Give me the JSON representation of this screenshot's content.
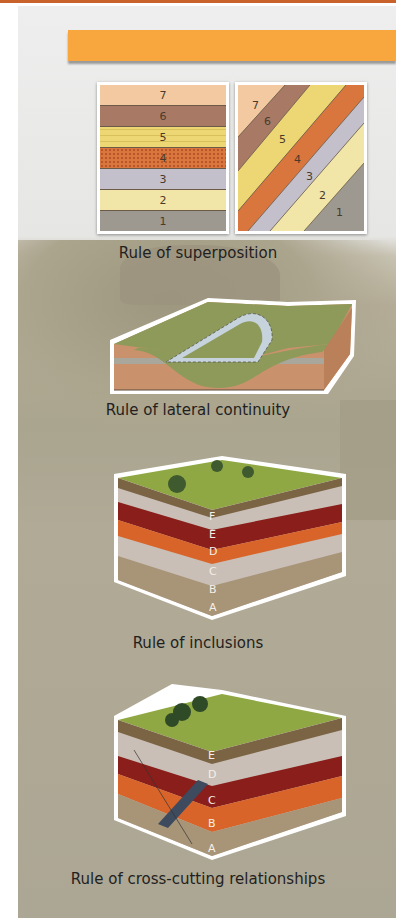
{
  "header": {
    "band_color": "#f8a63e",
    "top_rule_color": "#c8622a"
  },
  "figures": [
    {
      "id": "superposition",
      "caption": "Rule of superposition",
      "left_panel": {
        "layers": [
          {
            "label": "7",
            "color": "#f2c9a0"
          },
          {
            "label": "6",
            "color": "#a87a66"
          },
          {
            "label": "5",
            "color": "#ecd774"
          },
          {
            "label": "4",
            "color": "#d9763e"
          },
          {
            "label": "3",
            "color": "#c3c0cc"
          },
          {
            "label": "2",
            "color": "#f1e6a8"
          },
          {
            "label": "1",
            "color": "#9d9890"
          }
        ]
      },
      "right_panel": {
        "labels": [
          "7",
          "6",
          "5",
          "4",
          "3",
          "2",
          "1"
        ]
      }
    },
    {
      "id": "lateral-continuity",
      "caption": "Rule of lateral continuity"
    },
    {
      "id": "inclusions",
      "caption": "Rule of inclusions",
      "layer_labels": [
        "F",
        "E",
        "D",
        "C",
        "B",
        "A"
      ]
    },
    {
      "id": "cross-cutting",
      "caption": "Rule of cross-cutting relationships",
      "layer_labels": [
        "E",
        "D",
        "C",
        "B",
        "A"
      ]
    }
  ]
}
